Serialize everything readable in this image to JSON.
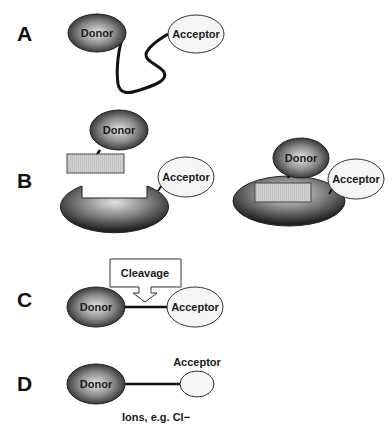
{
  "panels": {
    "A": {
      "label": "A",
      "donor": "Donor",
      "acceptor": "Acceptor",
      "description": "Donor and acceptor joined by a flexible linker"
    },
    "B": {
      "label": "B",
      "left": {
        "donor": "Donor",
        "acceptor": "Acceptor",
        "state": "unbound"
      },
      "right": {
        "donor": "Donor",
        "acceptor": "Acceptor",
        "state": "bound"
      }
    },
    "C": {
      "label": "C",
      "donor": "Donor",
      "acceptor": "Acceptor",
      "callout": "Cleavage"
    },
    "D": {
      "label": "D",
      "donor": "Donor",
      "acceptor": "Acceptor",
      "caption": "Ions, e.g. Cl−"
    }
  },
  "colors": {
    "donor_dark": "#2a2a2a",
    "donor_light": "#d8d8d8",
    "acceptor_fill": "#f4f4f4",
    "peptide_fill": "#cfcfcf",
    "stroke": "#111111"
  }
}
